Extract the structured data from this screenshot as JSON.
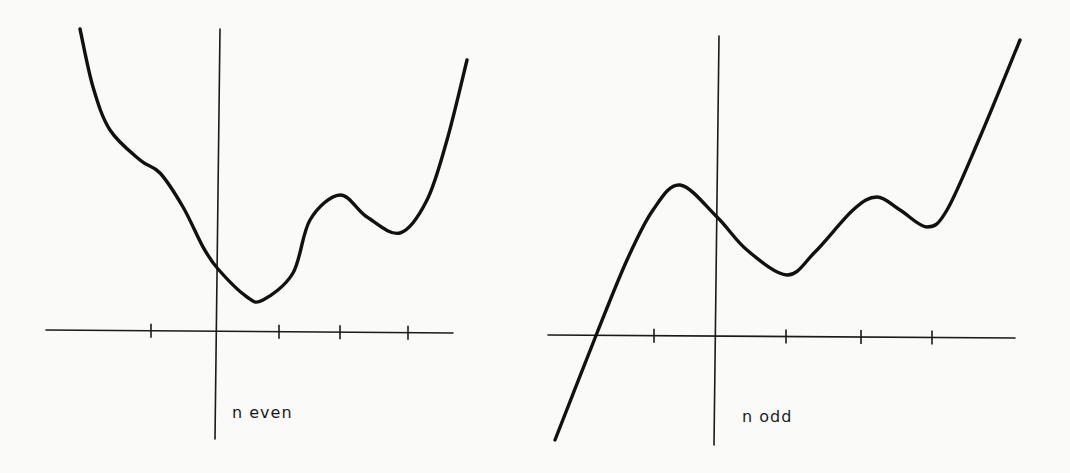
{
  "figure": {
    "background": "#fafaf8",
    "ink": "#111111"
  },
  "panels": [
    {
      "id": "even",
      "label": "n even",
      "label_pos": [
        232,
        418
      ],
      "x_axis": {
        "from": [
          46,
          330
        ],
        "to": [
          453,
          333
        ]
      },
      "y_axis": {
        "from": [
          220,
          29
        ],
        "to": [
          215,
          439
        ]
      },
      "ticks_x": [
        151,
        279,
        340,
        408
      ],
      "tick_half_len": 7,
      "curve_points": [
        [
          80,
          29
        ],
        [
          93,
          87
        ],
        [
          110,
          130
        ],
        [
          140,
          160
        ],
        [
          160,
          173
        ],
        [
          183,
          207
        ],
        [
          203,
          247
        ],
        [
          218,
          269
        ],
        [
          247,
          297
        ],
        [
          263,
          300
        ],
        [
          293,
          273
        ],
        [
          310,
          220
        ],
        [
          340,
          195
        ],
        [
          367,
          217
        ],
        [
          400,
          233
        ],
        [
          427,
          200
        ],
        [
          447,
          140
        ],
        [
          467,
          60
        ]
      ]
    },
    {
      "id": "odd",
      "label": "n odd",
      "label_pos": [
        742,
        422
      ],
      "x_axis": {
        "from": [
          548,
          335
        ],
        "to": [
          1015,
          338
        ]
      },
      "y_axis": {
        "from": [
          719,
          36
        ],
        "to": [
          714,
          445
        ]
      },
      "ticks_x": [
        654,
        786,
        861,
        932
      ],
      "tick_half_len": 7,
      "curve_points": [
        [
          555,
          440
        ],
        [
          597,
          333
        ],
        [
          627,
          260
        ],
        [
          653,
          210
        ],
        [
          680,
          185
        ],
        [
          717,
          217
        ],
        [
          747,
          250
        ],
        [
          787,
          275
        ],
        [
          815,
          252
        ],
        [
          853,
          210
        ],
        [
          877,
          197
        ],
        [
          900,
          210
        ],
        [
          927,
          227
        ],
        [
          947,
          210
        ],
        [
          980,
          137
        ],
        [
          1020,
          40
        ]
      ]
    }
  ],
  "chart_data": [
    {
      "type": "line",
      "title": "n even",
      "description": "Graph of an even-degree polynomial: rises to +infinity at both ends, with a shoulder on the left, a global minimum just right of the y-axis, a local maximum and a local minimum further right; stays above the x-axis (no real roots).",
      "x_ticks": [
        "-1",
        "0",
        "1",
        "2",
        "3"
      ],
      "grid": false,
      "legend": null,
      "features": {
        "left_end": "+inf",
        "right_end": "+inf",
        "global_min_x_approx": 0.7,
        "local_max_x_approx": 2.0,
        "local_min_x_approx": 3.0,
        "y_intercept": "positive",
        "real_roots": 0
      }
    },
    {
      "type": "line",
      "title": "n odd",
      "description": "Graph of an odd-degree polynomial: from -infinity on the left to +infinity on the right, one real root left of the first negative tick, local max near x=-0.5, local min near x=1, local max near x=2.2, local min near x=3, then rising.",
      "x_ticks": [
        "-1",
        "0",
        "1",
        "2",
        "3"
      ],
      "grid": false,
      "legend": null,
      "features": {
        "left_end": "-inf",
        "right_end": "+inf",
        "real_roots": 1,
        "root_x_approx": -1.8,
        "local_max_1_x_approx": -0.5,
        "local_min_1_x_approx": 1.0,
        "local_max_2_x_approx": 2.2,
        "local_min_2_x_approx": 3.0,
        "y_intercept": "positive"
      }
    }
  ]
}
